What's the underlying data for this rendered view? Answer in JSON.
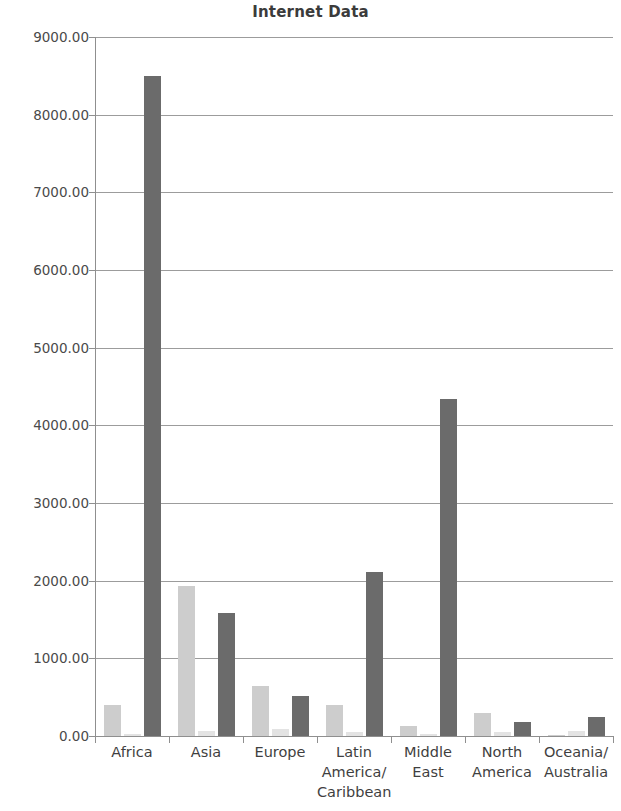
{
  "chart_data": {
    "type": "bar",
    "title": "Internet Data",
    "xlabel": "",
    "ylabel": "",
    "ylim": [
      0,
      9000
    ],
    "grid": true,
    "legend": "none",
    "categories": [
      "Africa",
      "Asia",
      "Europe",
      "Latin America/ Caribbean",
      "Middle East",
      "North America",
      "Oceania/ Australia"
    ],
    "ytick_labels": [
      "9000.00",
      "8000.00",
      "7000.00",
      "6000.00",
      "5000.00",
      "4000.00",
      "3000.00",
      "2000.00",
      "1000.00",
      "0.00"
    ],
    "ytick_values": [
      9000,
      8000,
      7000,
      6000,
      5000,
      4000,
      3000,
      2000,
      1000,
      0
    ],
    "series": [
      {
        "name": "series-1",
        "color": "#cdcdcd",
        "values": [
          400,
          1930,
          640,
          400,
          130,
          300,
          15
        ]
      },
      {
        "name": "series-2",
        "color": "#e3e3e3",
        "values": [
          30,
          60,
          95,
          55,
          25,
          55,
          60
        ]
      },
      {
        "name": "series-3",
        "color": "#6b6b6b",
        "values": [
          8500,
          1580,
          510,
          2110,
          4340,
          180,
          245
        ]
      }
    ]
  },
  "colors": {
    "title": "#3b3b3b",
    "axis": "#8f8f8f",
    "gridline": "#9c9c9c",
    "tick_text": "#4a4a4a",
    "category_text": "#3f3f3f",
    "background": "#ffffff"
  },
  "category_lines": [
    [
      "Africa"
    ],
    [
      "Asia"
    ],
    [
      "Europe"
    ],
    [
      "Latin",
      "America/",
      "Caribbean"
    ],
    [
      "Middle",
      "East"
    ],
    [
      "North",
      "America"
    ],
    [
      "Oceania/",
      "Australia"
    ]
  ]
}
